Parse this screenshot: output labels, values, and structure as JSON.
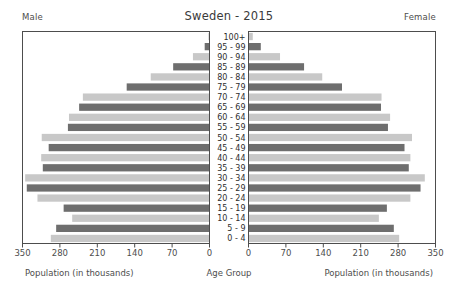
{
  "header": {
    "title": "Sweden - 2015",
    "male_label": "Male",
    "female_label": "Female"
  },
  "axis": {
    "male_title": "Population (in thousands)",
    "center_title": "Age Group",
    "female_title": "Population (in thousands)",
    "male_ticks": [
      "350",
      "280",
      "210",
      "140",
      "70",
      "0"
    ],
    "female_ticks": [
      "0",
      "70",
      "140",
      "210",
      "280",
      "350"
    ]
  },
  "style": {
    "bar_light": "#c8c8c8",
    "bar_dark": "#6e6e6e",
    "axis_color": "#4d4d4d",
    "plot_bg": "#ffffff"
  },
  "chart_data": {
    "type": "bar",
    "subtype": "population-pyramid",
    "title": "Sweden - 2015",
    "xlabel": "Population (in thousands)",
    "ylabel": "Age Group",
    "xlim": [
      0,
      350
    ],
    "grid": false,
    "legend": [
      "Male",
      "Female"
    ],
    "legend_position": "top-corners",
    "categories": [
      "100+",
      "95 - 99",
      "90 - 94",
      "85 - 89",
      "80 - 84",
      "75 - 79",
      "70 - 74",
      "65 - 69",
      "60 - 64",
      "55 - 59",
      "50 - 54",
      "45 - 49",
      "40 - 44",
      "35 - 39",
      "30 - 34",
      "25 - 29",
      "20 - 24",
      "15 - 19",
      "10 - 14",
      "5 - 9",
      "0 - 4"
    ],
    "series": [
      {
        "name": "Male",
        "direction": "left",
        "values": [
          2,
          9,
          31,
          68,
          110,
          155,
          237,
          244,
          263,
          265,
          314,
          301,
          315,
          312,
          345,
          342,
          322,
          273,
          257,
          287,
          297
        ]
      },
      {
        "name": "Female",
        "direction": "right",
        "values": [
          8,
          23,
          59,
          104,
          138,
          175,
          249,
          248,
          265,
          261,
          306,
          292,
          303,
          300,
          330,
          322,
          303,
          259,
          244,
          272,
          282
        ]
      }
    ]
  }
}
